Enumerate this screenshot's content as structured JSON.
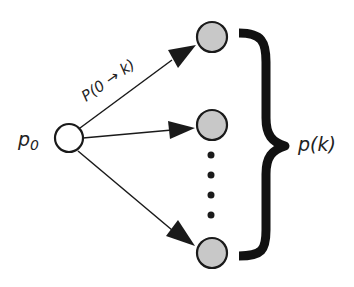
{
  "diagram": {
    "source_label": "p",
    "source_subscript": "0",
    "edge_label": "P(0 → k)",
    "group_label": "p(k)",
    "nodes": [
      {
        "id": "source",
        "role": "source",
        "fill": "#ffffff"
      },
      {
        "id": "target-top",
        "role": "target",
        "fill": "#c8c8c8"
      },
      {
        "id": "target-middle",
        "role": "target",
        "fill": "#c8c8c8"
      },
      {
        "id": "target-bottom",
        "role": "target",
        "fill": "#c8c8c8"
      }
    ],
    "ellipsis_dots": 4,
    "colors": {
      "stroke": "#1a1a1a",
      "target_fill": "#c8c8c8",
      "source_fill": "#ffffff",
      "text": "#222222"
    }
  }
}
